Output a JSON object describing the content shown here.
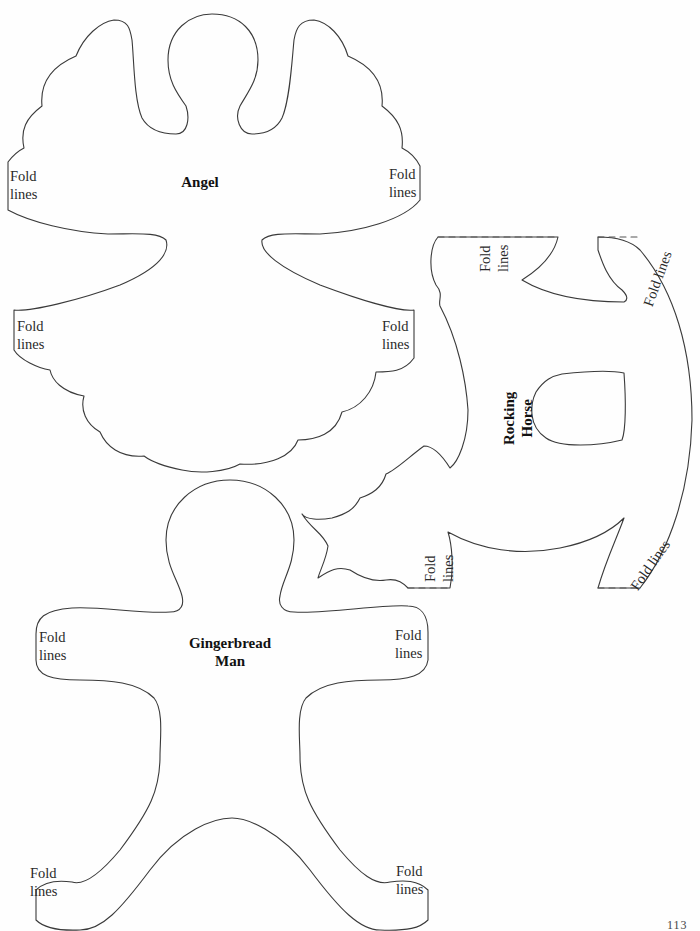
{
  "page": {
    "number": "113"
  },
  "templates": {
    "angel": {
      "title": "Angel",
      "fold_labels": [
        {
          "line1": "Fold",
          "line2": "lines"
        },
        {
          "line1": "Fold",
          "line2": "lines"
        },
        {
          "line1": "Fold",
          "line2": "lines"
        },
        {
          "line1": "Fold",
          "line2": "lines"
        }
      ]
    },
    "rocking_horse": {
      "title_line1": "Rocking",
      "title_line2": "Horse",
      "fold_labels": [
        {
          "line1": "Fold",
          "line2": "lines"
        },
        {
          "line1": "Fold lines"
        },
        {
          "line1": "Fold",
          "line2": "lines"
        },
        {
          "line1": "Fold lines"
        }
      ]
    },
    "gingerbread_man": {
      "title_line1": "Gingerbread",
      "title_line2": "Man",
      "fold_labels": [
        {
          "line1": "Fold",
          "line2": "lines"
        },
        {
          "line1": "Fold",
          "line2": "lines"
        },
        {
          "line1": "Fold",
          "line2": "lines"
        },
        {
          "line1": "Fold",
          "line2": "lines"
        }
      ]
    }
  },
  "colors": {
    "outline": "#3a3a3a",
    "background": "#fefefe"
  }
}
